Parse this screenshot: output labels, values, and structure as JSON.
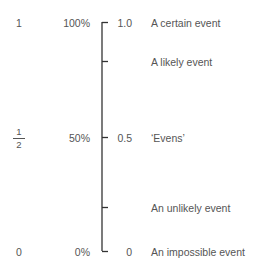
{
  "colors": {
    "text": "#555555",
    "axis": "#333333"
  },
  "scale": {
    "rows": [
      {
        "id": "certain",
        "fraction": "1",
        "percent": "100%",
        "decimal": "1.0",
        "description": "A certain event",
        "probability": 1.0,
        "tick_label": true
      },
      {
        "id": "likely",
        "fraction": "",
        "percent": "",
        "decimal": "",
        "description": "A likely event",
        "probability": 0.83,
        "tick_label": false
      },
      {
        "id": "evens",
        "fraction_num": "1",
        "fraction_den": "2",
        "percent": "50%",
        "decimal": "0.5",
        "description": "‘Evens’",
        "probability": 0.5,
        "tick_label": true
      },
      {
        "id": "unlikely",
        "fraction": "",
        "percent": "",
        "decimal": "",
        "description": "An unlikely event",
        "probability": 0.19,
        "tick_label": false
      },
      {
        "id": "impossible",
        "fraction": "0",
        "percent": "0%",
        "decimal": "0",
        "description": "An impossible event",
        "probability": 0.0,
        "tick_label": true
      }
    ]
  }
}
